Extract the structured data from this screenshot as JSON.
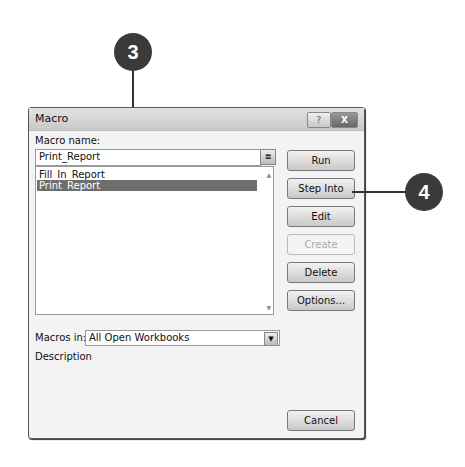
{
  "dialog": {
    "title": "Macro",
    "help_glyph": "?",
    "close_glyph": "X",
    "macro_name_label": "Macro name:",
    "macro_name_value": "Print_Report",
    "ref_glyph": "≣",
    "list_items": [
      {
        "label": "Fill_In_Report",
        "selected": false
      },
      {
        "label": "Print_Report",
        "selected": true
      }
    ],
    "buttons": {
      "run": "Run",
      "step_into": "Step Into",
      "edit": "Edit",
      "create": "Create",
      "delete": "Delete",
      "options": "Options...",
      "cancel": "Cancel"
    },
    "macros_in_label": "Macros in:",
    "macros_in_value": "All Open Workbooks",
    "description_label": "Description"
  },
  "callouts": [
    {
      "number": "3"
    },
    {
      "number": "4"
    }
  ]
}
